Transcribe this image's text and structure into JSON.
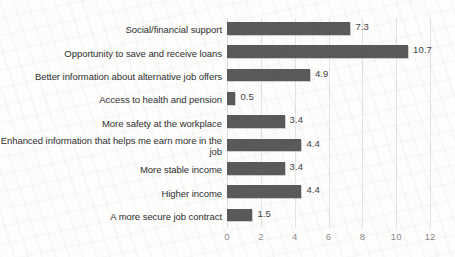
{
  "chart_data": {
    "type": "bar",
    "orientation": "horizontal",
    "title": "",
    "subtitle": "",
    "xlabel": "",
    "ylabel": "",
    "xlim": [
      0,
      12
    ],
    "xticks": [
      "0",
      "2",
      "4",
      "6",
      "8",
      "10",
      "12"
    ],
    "grid": "vertical",
    "legend": "none",
    "bar_color": "#595959",
    "gridline_color": "#e3e3e3",
    "label_color": "#2e2e2e",
    "tick_color": "#8c8c8c",
    "categories": [
      "Social/financial support",
      "Opportunity to save and receive loans",
      "Better information about alternative job offers",
      "Access to health and pension",
      "More safety at the workplace",
      "Enhanced information that helps me earn more in the job",
      "More stable income",
      "Higher income",
      "A more secure job contract"
    ],
    "values": [
      7.3,
      10.7,
      4.9,
      0.5,
      3.4,
      4.4,
      3.4,
      4.4,
      1.5
    ],
    "value_labels": [
      "7.3",
      "10.7",
      "4.9",
      "0.5",
      "3.4",
      "4.4",
      "3.4",
      "4.4",
      "1.5"
    ]
  }
}
